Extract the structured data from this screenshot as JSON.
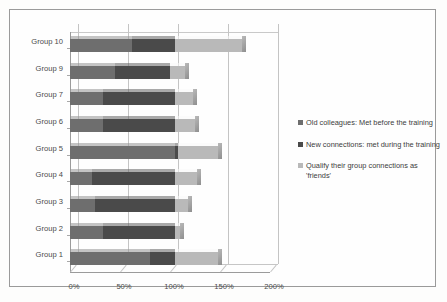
{
  "chart_data": {
    "type": "bar",
    "orientation": "horizontal",
    "stacked": true,
    "title": "",
    "xlabel": "",
    "ylabel": "",
    "xlim": [
      0,
      200
    ],
    "xticks": [
      "0%",
      "50%",
      "100%",
      "150%",
      "200%"
    ],
    "xtick_values": [
      0,
      50,
      100,
      150,
      200
    ],
    "grid": true,
    "legend_position": "right",
    "categories": [
      "Group 1",
      "Group 2",
      "Group 3",
      "Group 4",
      "Group 5",
      "Group 6",
      "Group 7",
      "Group 9",
      "Group 10"
    ],
    "categories_top_to_bottom": [
      "Group 10",
      "Group 9",
      "Group 7",
      "Group 6",
      "Group 5",
      "Group 4",
      "Group 3",
      "Group 2",
      "Group 1"
    ],
    "series": [
      {
        "name": "Old colleagues: Met before the training",
        "color": "#6e6e6e",
        "values": [
          80,
          33,
          25,
          22,
          105,
          33,
          33,
          45,
          62
        ]
      },
      {
        "name": "New connections: met during the training",
        "color": "#4a4a4a",
        "values": [
          25,
          72,
          80,
          83,
          3,
          72,
          72,
          55,
          43
        ]
      },
      {
        "name": "Qualify their group connections as 'friends'",
        "color": "#b9b9b9",
        "values": [
          43,
          5,
          13,
          22,
          40,
          20,
          18,
          15,
          67
        ]
      }
    ],
    "totals": [
      148,
      110,
      118,
      127,
      148,
      125,
      123,
      115,
      172
    ]
  },
  "legend": {
    "items": [
      {
        "label": "Old colleagues: Met before the training",
        "color": "#6e6e6e"
      },
      {
        "label": "New connections: met during the training",
        "color": "#4a4a4a"
      },
      {
        "label": "Qualify their group connections as 'friends'",
        "color": "#b9b9b9"
      }
    ]
  },
  "axis": {
    "x_ticks": [
      "0%",
      "50%",
      "100%",
      "150%",
      "200%"
    ],
    "y_labels": [
      "Group 10",
      "Group 9",
      "Group 7",
      "Group 6",
      "Group 5",
      "Group 4",
      "Group 3",
      "Group 2",
      "Group 1"
    ]
  }
}
